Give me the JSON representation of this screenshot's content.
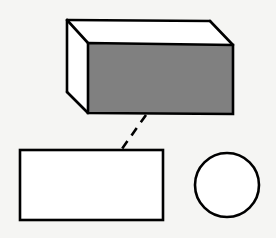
{
  "figure": {
    "title": "Rectangular prism with rectangular face and circle",
    "canvas": {
      "width": 276,
      "height": 238
    },
    "background_color": "#f5f5f3",
    "stroke_color": "#000000",
    "shapes": [
      {
        "id": "cuboid",
        "name": "rectangular-prism",
        "label": "Rectangular prism (box)",
        "projection": "oblique",
        "stroke_width": 2.6,
        "faces": [
          {
            "name": "front-face",
            "fill": "#808080",
            "points": "88,43 233,45 233,114 88,113"
          },
          {
            "name": "top-face",
            "fill": "#ffffff",
            "points": "88,43 67,20 210,21 233,45"
          },
          {
            "name": "left-face",
            "fill": "#ffffff",
            "points": "88,43 67,20 67,92 88,113"
          }
        ],
        "edges": [
          {
            "name": "front-top-edge",
            "x1": 88,
            "y1": 43,
            "x2": 233,
            "y2": 45
          },
          {
            "name": "front-right-edge",
            "x1": 233,
            "y1": 45,
            "x2": 233,
            "y2": 114
          },
          {
            "name": "front-bottom-edge",
            "x1": 233,
            "y1": 114,
            "x2": 88,
            "y2": 113
          },
          {
            "name": "front-left-edge",
            "x1": 88,
            "y1": 113,
            "x2": 88,
            "y2": 43
          },
          {
            "name": "top-left-receding-edge",
            "x1": 88,
            "y1": 43,
            "x2": 67,
            "y2": 20
          },
          {
            "name": "back-top-edge",
            "x1": 67,
            "y1": 20,
            "x2": 210,
            "y2": 21
          },
          {
            "name": "top-right-receding-edge",
            "x1": 210,
            "y1": 21,
            "x2": 233,
            "y2": 45
          },
          {
            "name": "back-left-vertical-edge",
            "x1": 67,
            "y1": 20,
            "x2": 67,
            "y2": 92
          },
          {
            "name": "bottom-left-receding-edge",
            "x1": 67,
            "y1": 92,
            "x2": 88,
            "y2": 113
          }
        ]
      },
      {
        "id": "rectangle",
        "name": "rectangle",
        "label": "Rectangle",
        "fill": "#ffffff",
        "stroke_width": 2.6,
        "x": 20,
        "y": 150,
        "width": 143,
        "height": 70
      },
      {
        "id": "circle",
        "name": "circle",
        "label": "Circle",
        "fill": "#ffffff",
        "stroke_width": 2.6,
        "cx": 227,
        "cy": 185,
        "r": 32
      }
    ],
    "connector": {
      "name": "dashed-leader-line",
      "label": "Dashed leader line",
      "style": "dashed",
      "stroke_width": 2.6,
      "dash_pattern": "9 7",
      "x1": 146,
      "y1": 115,
      "x2": 119,
      "y2": 153
    }
  }
}
